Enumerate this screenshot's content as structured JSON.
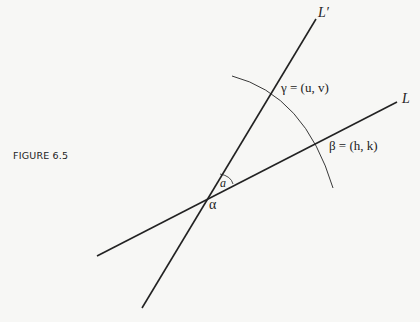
{
  "figure": {
    "caption": "FIGURE  6.5"
  },
  "labels": {
    "line_L_prime": "L′",
    "line_L": "L",
    "gamma": "γ = (u, v)",
    "beta": "β = (h, k)",
    "alpha": "α",
    "angle": "a"
  },
  "colors": {
    "ink": "#222222",
    "background": "#f7f7f5"
  }
}
